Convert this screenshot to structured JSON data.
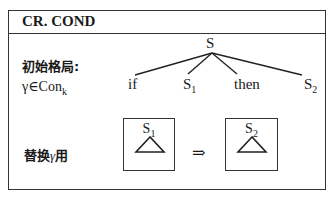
{
  "rule": {
    "title": "CR. COND",
    "initial_config_label": "初始格局:",
    "condition": {
      "gamma": "γ",
      "in": "∈",
      "con": "Con",
      "sub": "k"
    },
    "replace_label": {
      "prefix": "替换",
      "gamma": "γ",
      "suffix": "用"
    }
  },
  "tree": {
    "root": "S",
    "children": [
      {
        "text": "if"
      },
      {
        "text": "S",
        "sub": "1"
      },
      {
        "text": "then"
      },
      {
        "text": "S",
        "sub": "2"
      }
    ]
  },
  "replacement": {
    "from": {
      "text": "S",
      "sub": "1"
    },
    "arrow": "⇒",
    "to": {
      "text": "S",
      "sub": "2"
    }
  }
}
